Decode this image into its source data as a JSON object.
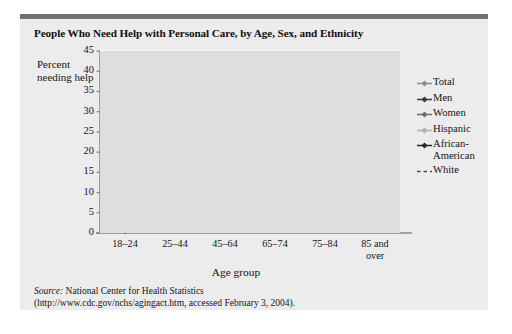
{
  "figure": {
    "title": "People Who Need Help with Personal Care, by Age, Sex, and Ethnicity",
    "source_word": "Source:",
    "source_line1": " National Center for Health Statistics",
    "source_line2": "(http://www.cdc.gov/nchs/agingact.htm, accessed February 3, 2004)."
  },
  "colors": {
    "card_bg": "#ececed",
    "plot_bg": "#dedede",
    "grid": "#ffffff",
    "top_rule": "#707073",
    "axis": "#8a8a8d",
    "total": "#8c8c8c",
    "men": "#3a3a3a",
    "women": "#6e6e6e",
    "hispanic": "#b0b0b0",
    "african_american": "#2b2b2b",
    "white": "#4a4a4a"
  },
  "chart_data": {
    "type": "line",
    "title": "People Who Need Help with Personal Care, by Age, Sex, and Ethnicity",
    "xlabel": "Age group",
    "ylabel": "Percent needing help",
    "categories": [
      "18–24",
      "25–44",
      "45–64",
      "65–74",
      "75–84",
      "85 and\nover"
    ],
    "ylim": [
      0,
      45
    ],
    "yticks": [
      0,
      5,
      10,
      15,
      20,
      25,
      30,
      35,
      40,
      45
    ],
    "grid": true,
    "legend_position": "right",
    "series": [
      {
        "name": "Total",
        "values": [
          0.5,
          0.8,
          2.0,
          4.2,
          8.0,
          19.8
        ],
        "marker": "diamond",
        "dashed": false
      },
      {
        "name": "Men",
        "values": [
          0.5,
          0.8,
          2.0,
          4.0,
          7.5,
          17.0
        ],
        "marker": "diamond",
        "dashed": false
      },
      {
        "name": "Women",
        "values": [
          0.5,
          0.8,
          2.1,
          4.5,
          8.4,
          19.2
        ],
        "marker": "diamond",
        "dashed": false
      },
      {
        "name": "Hispanic",
        "values": [
          0.5,
          0.8,
          2.2,
          5.0,
          14.0,
          39.8
        ],
        "marker": "diamond",
        "dashed": false
      },
      {
        "name": "African-\nAmerican",
        "values": [
          0.5,
          0.9,
          2.3,
          8.6,
          14.0,
          24.0
        ],
        "marker": "diamond",
        "dashed": false
      },
      {
        "name": "White",
        "values": [
          0.5,
          0.8,
          1.9,
          3.9,
          7.3,
          18.4
        ],
        "marker": "none",
        "dashed": true
      }
    ]
  }
}
